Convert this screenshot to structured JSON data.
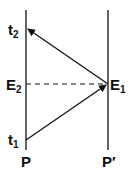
{
  "diagram": {
    "labels": {
      "t2": {
        "base": "t",
        "sub": "2"
      },
      "t1": {
        "base": "t",
        "sub": "1"
      },
      "E2": {
        "base": "E",
        "sub": "2"
      },
      "E1": {
        "base": "E",
        "sub": "1"
      },
      "P": "P",
      "P_prime": "P′"
    },
    "edges": [
      {
        "from": "t1",
        "to": "E1",
        "style": "solid-arrow"
      },
      {
        "from": "E1",
        "to": "t2",
        "style": "solid-arrow"
      },
      {
        "from": "E2",
        "to": "E1",
        "style": "dashed"
      }
    ]
  }
}
